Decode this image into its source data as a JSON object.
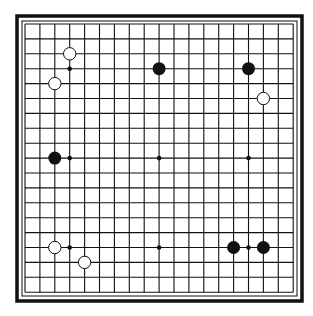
{
  "diagram": {
    "type": "go-board",
    "size": 19,
    "colors": {
      "line": "#111111",
      "black_stone": "#111111",
      "white_stone": "#ffffff",
      "background": "#ffffff"
    },
    "star_points": [
      [
        3,
        3
      ],
      [
        9,
        3
      ],
      [
        15,
        3
      ],
      [
        3,
        9
      ],
      [
        9,
        9
      ],
      [
        15,
        9
      ],
      [
        3,
        15
      ],
      [
        9,
        15
      ],
      [
        15,
        15
      ]
    ],
    "stones": [
      {
        "color": "white",
        "col": 3,
        "row": 2
      },
      {
        "color": "white",
        "col": 2,
        "row": 4
      },
      {
        "color": "black",
        "col": 9,
        "row": 3
      },
      {
        "color": "black",
        "col": 15,
        "row": 3
      },
      {
        "color": "white",
        "col": 16,
        "row": 5
      },
      {
        "color": "black",
        "col": 2,
        "row": 9
      },
      {
        "color": "white",
        "col": 2,
        "row": 15
      },
      {
        "color": "white",
        "col": 4,
        "row": 16
      },
      {
        "color": "black",
        "col": 14,
        "row": 15
      },
      {
        "color": "black",
        "col": 16,
        "row": 15
      }
    ]
  }
}
